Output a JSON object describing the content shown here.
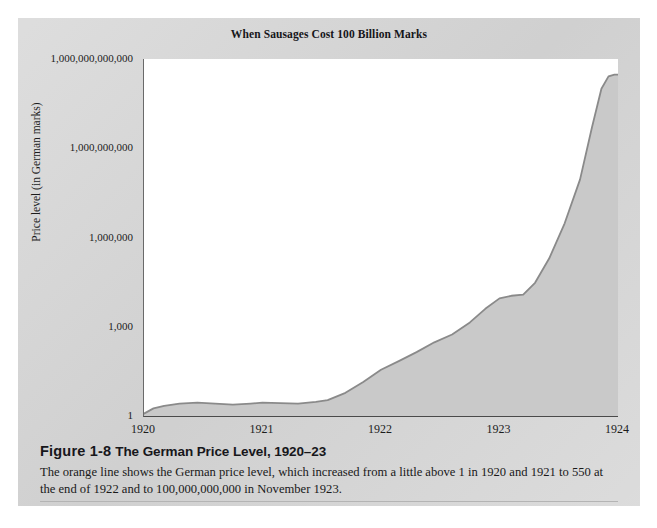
{
  "figure": {
    "chart_title": "When Sausages Cost 100 Billion Marks",
    "caption_figure_number": "Figure 1-8",
    "caption_heading": "The German Price Level, 1920–23",
    "caption_body": "The orange line shows the German price level, which increased from a little above 1 in 1920 and 1921 to 550 at the end of 1922 and to 100,000,000,000 in November 1923.",
    "panel_color": "#d4d4d4",
    "plot_background": "#ffffff",
    "series_fill_color": "#c9c9c9",
    "series_line_color": "#8a8a8a"
  },
  "chart_data": {
    "type": "area",
    "title": "When Sausages Cost 100 Billion Marks",
    "xlabel": "",
    "ylabel": "Price level (in German marks)",
    "yscale": "log",
    "ylim": [
      1,
      1000000000000
    ],
    "xlim": [
      1920,
      1924
    ],
    "grid": false,
    "legend": null,
    "ytick_labels": [
      "1,000,000,000,000",
      "1,000,000,000",
      "1,000,000",
      "1,000",
      "1"
    ],
    "ytick_values": [
      1000000000000,
      1000000000,
      1000000,
      1000,
      1
    ],
    "xtick_labels": [
      "1920",
      "1921",
      "1922",
      "1923",
      "1924"
    ],
    "xtick_values": [
      1920,
      1921,
      1922,
      1923,
      1924
    ],
    "series": [
      {
        "name": "German price level",
        "x": [
          1920.0,
          1920.08,
          1920.17,
          1920.3,
          1920.45,
          1920.6,
          1920.75,
          1920.9,
          1921.0,
          1921.15,
          1921.3,
          1921.45,
          1921.55,
          1921.7,
          1921.85,
          1922.0,
          1922.15,
          1922.3,
          1922.45,
          1922.6,
          1922.75,
          1922.88,
          1923.0,
          1923.1,
          1923.2,
          1923.3,
          1923.42,
          1923.55,
          1923.68,
          1923.78,
          1923.86,
          1923.92,
          1923.97,
          1924.0
        ],
        "y": [
          1.2,
          1.8,
          2.2,
          2.6,
          2.8,
          2.6,
          2.4,
          2.6,
          2.8,
          2.7,
          2.6,
          3.0,
          3.4,
          6.0,
          14.0,
          36.0,
          70.0,
          140.0,
          300.0,
          550.0,
          1400.0,
          4000.0,
          9000.0,
          11000.0,
          12000.0,
          30000.0,
          200000.0,
          3000000.0,
          90000000.0,
          5000000000.0,
          100000000000.0,
          260000000000.0,
          300000000000.0,
          300000000000.0
        ],
        "annotations": [
          {
            "label": "a little above 1 in 1920 and 1921",
            "value": 1
          },
          {
            "label": "550 at the end of 1922",
            "value": 550
          },
          {
            "label": "100,000,000,000 in November 1923",
            "value": 100000000000
          }
        ]
      }
    ]
  }
}
